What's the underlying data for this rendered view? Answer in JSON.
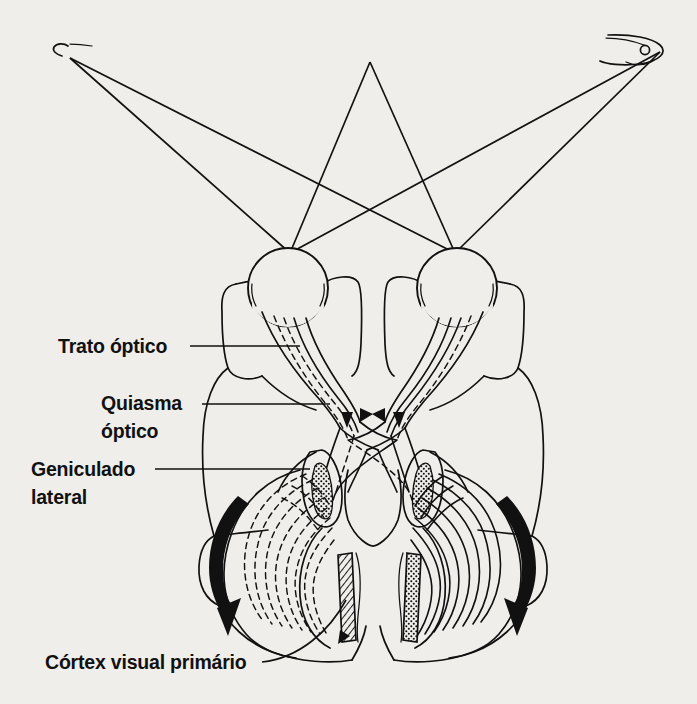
{
  "figure": {
    "background_color": "#efeeea",
    "ink_color": "#111111",
    "language": "pt-BR"
  },
  "labels": [
    {
      "id": "trato-optico",
      "text": "Trato óptico",
      "lines": [
        "Trato óptico"
      ],
      "x": 58,
      "y": 351
    },
    {
      "id": "quiasma-optico",
      "text": "Quiasma óptico",
      "lines": [
        "Quiasma",
        "óptico"
      ],
      "x": 101,
      "y": 409
    },
    {
      "id": "geniculado-lateral",
      "text": "Geniculado lateral",
      "lines": [
        "Geniculado",
        "lateral"
      ],
      "x": 31,
      "y": 474
    },
    {
      "id": "cortex-visual-primario",
      "text": "Córtex visual primário",
      "lines": [
        "Córtex visual primário"
      ],
      "x": 45,
      "y": 668
    }
  ],
  "label_text": {
    "trato_optico": "Trato óptico",
    "quiasma_linha1": "Quiasma",
    "quiasma_linha2": "óptico",
    "geniculado_linha1": "Geniculado",
    "geniculado_linha2": "lateral",
    "cortex_visual_primario": "Córtex visual primário"
  },
  "visual_field": {
    "name": "campo-visual-barra",
    "left_half_pattern": "stipple",
    "right_half_pattern": "hatch",
    "left_end": "cauda",
    "right_end": "cabeca-com-olho",
    "midpoint_x": 370,
    "bar_top_y": 34,
    "bar_bottom_y": 64
  },
  "rays": {
    "name": "raios-de-luz",
    "count": 6,
    "left_field_point": {
      "x": 70,
      "y": 58
    },
    "center_field_point": {
      "x": 370,
      "y": 62
    },
    "right_field_point": {
      "x": 660,
      "y": 52
    },
    "left_eye_node": {
      "x": 290,
      "y": 253
    },
    "right_eye_node": {
      "x": 455,
      "y": 253
    }
  },
  "eyes": [
    {
      "name": "olho-esquerdo",
      "cx": 288,
      "cy": 288,
      "r": 40,
      "nasal_pattern": "stipple",
      "temporal_pattern": "hatch"
    },
    {
      "name": "olho-direito",
      "cx": 457,
      "cy": 288,
      "r": 40,
      "nasal_pattern": "hatch",
      "temporal_pattern": "stipple"
    }
  ],
  "pathway": {
    "optic_nerve": "nervo-óptico",
    "chiasm": {
      "name": "quiasma-óptico",
      "cx": 372,
      "cy": 418
    },
    "optic_tract": "trato-óptico",
    "lgn_left": {
      "name": "geniculado-lateral-esquerdo",
      "cx": 326,
      "cy": 490
    },
    "lgn_right": {
      "name": "geniculado-lateral-direito",
      "cx": 419,
      "cy": 490
    },
    "radiation_left_style": "tracejado",
    "radiation_right_style": "contínuo",
    "cortex_left_pattern": "hatch",
    "cortex_right_pattern": "stipple"
  },
  "arrows": {
    "chiasm_arrow_count": 4,
    "radiation_arrow_left": "seta-curva-esquerda",
    "radiation_arrow_right": "seta-curva-direita"
  }
}
